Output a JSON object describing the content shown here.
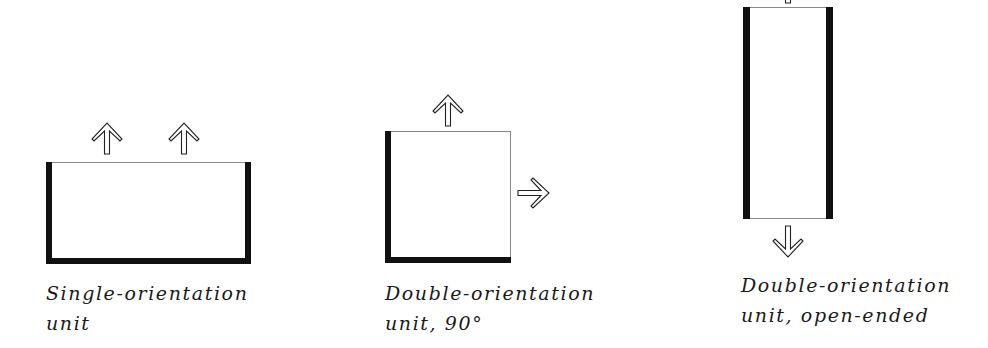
{
  "units": [
    {
      "id": "single",
      "caption_line1": "Single-orientation",
      "caption_line2": "unit",
      "open_sides": [
        "top"
      ],
      "arrows": [
        "up",
        "up"
      ]
    },
    {
      "id": "double-90",
      "caption_line1": "Double-orientation",
      "caption_line2": "unit, 90°",
      "open_sides": [
        "top",
        "right"
      ],
      "arrows": [
        "up",
        "right"
      ]
    },
    {
      "id": "double-open-ended",
      "caption_line1": "Double-orientation",
      "caption_line2": "unit, open-ended",
      "open_sides": [
        "top",
        "bottom"
      ],
      "arrows": [
        "up",
        "down"
      ]
    }
  ],
  "colors": {
    "wall": "#111111",
    "open_edge": "#888888",
    "background": "#ffffff"
  }
}
